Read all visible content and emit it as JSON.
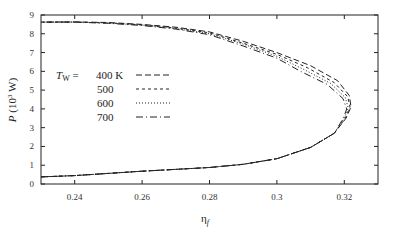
{
  "chart_data": {
    "type": "line",
    "title": "",
    "xlabel": "η_f",
    "ylabel": "P (10^3 W)",
    "xlim": [
      0.23,
      0.33
    ],
    "ylim": [
      0,
      9
    ],
    "x_ticks": [
      "0.24",
      "0.26",
      "0.28",
      "0.3",
      "0.32"
    ],
    "y_ticks": [
      "0",
      "1",
      "2",
      "3",
      "4",
      "5",
      "6",
      "7",
      "8",
      "9"
    ],
    "grid": false,
    "legend_title": "T_W =",
    "legend_position": "left-middle",
    "series": [
      {
        "name": "400 K",
        "style": "dashed",
        "points": [
          [
            0.23,
            0.38
          ],
          [
            0.24,
            0.45
          ],
          [
            0.26,
            0.68
          ],
          [
            0.28,
            0.88
          ],
          [
            0.29,
            1.05
          ],
          [
            0.3,
            1.35
          ],
          [
            0.31,
            1.95
          ],
          [
            0.317,
            2.7
          ],
          [
            0.3205,
            3.5
          ],
          [
            0.322,
            4.1
          ],
          [
            0.3215,
            4.7
          ],
          [
            0.318,
            5.5
          ],
          [
            0.31,
            6.3
          ],
          [
            0.3,
            7.0
          ],
          [
            0.29,
            7.6
          ],
          [
            0.28,
            8.1
          ],
          [
            0.27,
            8.35
          ],
          [
            0.26,
            8.5
          ],
          [
            0.25,
            8.6
          ],
          [
            0.24,
            8.63
          ],
          [
            0.23,
            8.62
          ]
        ]
      },
      {
        "name": "500",
        "style": "short-dashed",
        "points": [
          [
            0.23,
            0.38
          ],
          [
            0.24,
            0.45
          ],
          [
            0.26,
            0.68
          ],
          [
            0.28,
            0.88
          ],
          [
            0.29,
            1.05
          ],
          [
            0.3,
            1.35
          ],
          [
            0.31,
            1.95
          ],
          [
            0.317,
            2.7
          ],
          [
            0.3203,
            3.5
          ],
          [
            0.3217,
            4.1
          ],
          [
            0.321,
            4.65
          ],
          [
            0.317,
            5.4
          ],
          [
            0.309,
            6.2
          ],
          [
            0.3,
            6.9
          ],
          [
            0.29,
            7.5
          ],
          [
            0.28,
            8.05
          ],
          [
            0.27,
            8.3
          ],
          [
            0.26,
            8.48
          ],
          [
            0.25,
            8.58
          ],
          [
            0.24,
            8.62
          ],
          [
            0.23,
            8.62
          ]
        ]
      },
      {
        "name": "600",
        "style": "dotted",
        "points": [
          [
            0.23,
            0.38
          ],
          [
            0.24,
            0.45
          ],
          [
            0.26,
            0.68
          ],
          [
            0.28,
            0.88
          ],
          [
            0.29,
            1.05
          ],
          [
            0.3,
            1.35
          ],
          [
            0.31,
            1.95
          ],
          [
            0.317,
            2.7
          ],
          [
            0.32,
            3.5
          ],
          [
            0.3212,
            4.05
          ],
          [
            0.3203,
            4.6
          ],
          [
            0.316,
            5.35
          ],
          [
            0.308,
            6.1
          ],
          [
            0.3,
            6.8
          ],
          [
            0.29,
            7.45
          ],
          [
            0.28,
            8.0
          ],
          [
            0.27,
            8.28
          ],
          [
            0.26,
            8.46
          ],
          [
            0.25,
            8.57
          ],
          [
            0.24,
            8.62
          ],
          [
            0.23,
            8.62
          ]
        ]
      },
      {
        "name": "700",
        "style": "dash-dot",
        "points": [
          [
            0.23,
            0.38
          ],
          [
            0.24,
            0.45
          ],
          [
            0.26,
            0.68
          ],
          [
            0.28,
            0.88
          ],
          [
            0.29,
            1.05
          ],
          [
            0.3,
            1.35
          ],
          [
            0.31,
            1.95
          ],
          [
            0.317,
            2.7
          ],
          [
            0.3197,
            3.5
          ],
          [
            0.3207,
            4.0
          ],
          [
            0.3196,
            4.55
          ],
          [
            0.315,
            5.3
          ],
          [
            0.307,
            6.0
          ],
          [
            0.3,
            6.7
          ],
          [
            0.29,
            7.35
          ],
          [
            0.28,
            7.95
          ],
          [
            0.27,
            8.25
          ],
          [
            0.26,
            8.44
          ],
          [
            0.25,
            8.56
          ],
          [
            0.24,
            8.62
          ],
          [
            0.23,
            8.62
          ]
        ]
      }
    ]
  },
  "axes": {
    "x_label_main": "η",
    "x_label_sub": "f",
    "y_label_main": "P",
    "y_label_unit": " (10",
    "y_label_exp": "3",
    "y_label_end": " W)"
  },
  "legend": {
    "title_main": "T",
    "title_sub": "W",
    "title_eq": " =",
    "entries": [
      "400  K",
      "500",
      "600",
      "700"
    ]
  }
}
